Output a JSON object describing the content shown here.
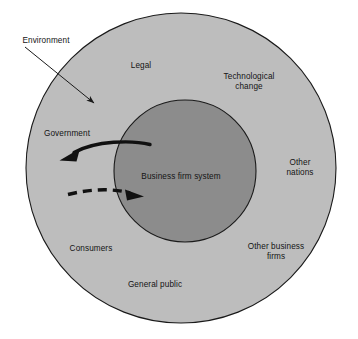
{
  "diagram": {
    "type": "concentric-circles",
    "colors": {
      "background": "#ffffff",
      "outer_ring_fill": "#bdbdbd",
      "inner_circle_fill": "#8c8c8c",
      "stroke": "#1a1a1a",
      "text": "#141414"
    },
    "shapes": {
      "outer_circle": {
        "cx": 181,
        "cy": 168,
        "r": 155,
        "label": "environment-circle"
      },
      "inner_circle": {
        "cx": 185,
        "cy": 171,
        "r": 71,
        "label": "business-firm-system-circle"
      }
    },
    "callout": {
      "label": "Environment",
      "label_x": 46,
      "label_y": 41,
      "arrow_from_x": 25,
      "arrow_from_y": 47,
      "arrow_to_x": 97,
      "arrow_to_y": 106
    },
    "arrows": [
      {
        "name": "outbound-influence-arrow",
        "style": "solid",
        "direction": "firm-to-environment",
        "from_x": 150,
        "from_y": 145,
        "to_x": 60,
        "to_y": 160
      },
      {
        "name": "inbound-influence-arrow",
        "style": "dashed",
        "direction": "environment-to-firm",
        "from_x": 68,
        "from_y": 196,
        "to_x": 142,
        "to_y": 196
      }
    ],
    "center_label": {
      "text": "Business firm system",
      "x": 181,
      "y": 177
    },
    "environment_labels": [
      {
        "name": "label-legal",
        "text": "Legal",
        "x": 141,
        "y": 66
      },
      {
        "name": "label-technological-change",
        "text": "Technological\nchange",
        "x": 249,
        "y": 82
      },
      {
        "name": "label-government",
        "text": "Government",
        "x": 67,
        "y": 134
      },
      {
        "name": "label-other-nations",
        "text": "Other\nnations",
        "x": 300,
        "y": 168
      },
      {
        "name": "label-consumers",
        "text": "Consumers",
        "x": 91,
        "y": 249
      },
      {
        "name": "label-other-business-firms",
        "text": "Other business\nfirms",
        "x": 276,
        "y": 252
      },
      {
        "name": "label-general-public",
        "text": "General public",
        "x": 155,
        "y": 285
      }
    ]
  }
}
